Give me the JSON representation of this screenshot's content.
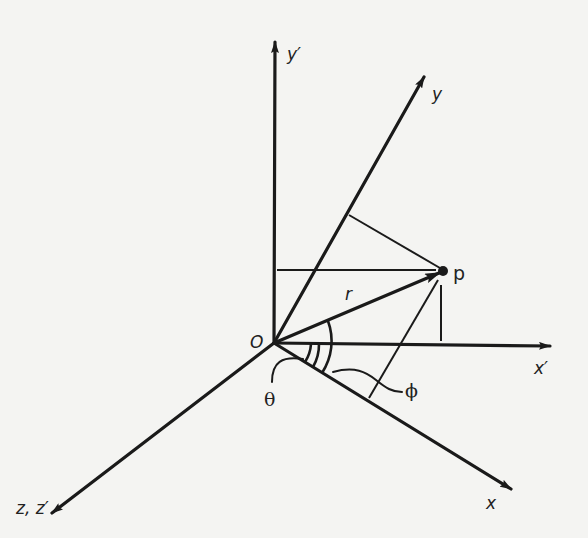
{
  "diagram": {
    "title": "",
    "origin": {
      "label": "O",
      "x": 274,
      "y": 343
    },
    "point": {
      "label": "p",
      "x": 443,
      "y": 271
    },
    "vector": {
      "label": "r"
    },
    "angles": [
      {
        "label": "θ",
        "description": "angle between x' axis and x axis"
      },
      {
        "label": "ϕ",
        "description": "angle between x axis and r"
      }
    ],
    "axes": [
      {
        "id": "y_prime",
        "label": "y′",
        "tip": [
          275,
          40
        ]
      },
      {
        "id": "y",
        "label": "y",
        "tip": [
          425,
          75
        ]
      },
      {
        "id": "x_prime",
        "label": "x′",
        "tip": [
          552,
          346
        ]
      },
      {
        "id": "x",
        "label": "x",
        "tip": [
          513,
          490
        ]
      },
      {
        "id": "z",
        "label": "z, z′",
        "tip": [
          50,
          515
        ]
      }
    ],
    "colors": {
      "ink": "#1a1a1a",
      "paper": "#f4f4f2"
    }
  }
}
